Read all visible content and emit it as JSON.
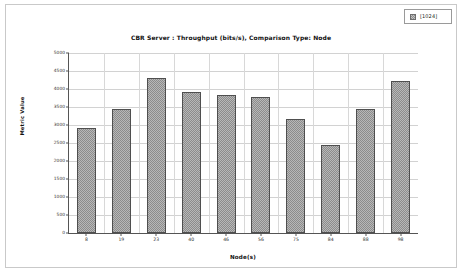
{
  "legend": {
    "entries": [
      {
        "label": "[1024]",
        "swatch_icon": "pattern-swatch-icon",
        "color": "#8c8c8c"
      }
    ]
  },
  "axes": {
    "y_title": "Metric Value",
    "x_title": "Node(s)"
  },
  "chart_data": {
    "type": "bar",
    "title": "CBR Server :  Throughput (bits/s), Comparison Type: Node",
    "xlabel": "Node(s)",
    "ylabel": "Metric Value",
    "categories": [
      "8",
      "19",
      "23",
      "40",
      "46",
      "56",
      "75",
      "84",
      "88",
      "98"
    ],
    "values": [
      2930,
      3450,
      4300,
      3920,
      3840,
      3780,
      3170,
      2450,
      3450,
      4230
    ],
    "series": [
      {
        "name": "[1024]",
        "values": [
          2930,
          3450,
          4300,
          3920,
          3840,
          3780,
          3170,
          2450,
          3450,
          4230
        ]
      }
    ],
    "ylim": [
      0,
      5000
    ],
    "yticks": [
      0,
      500,
      1000,
      1500,
      2000,
      2500,
      3000,
      3500,
      4000,
      4500,
      5000
    ],
    "ytick_labels": [
      "0",
      "500",
      "1000",
      "1500",
      "2000",
      "2500",
      "3000",
      "3500",
      "4000",
      "4500",
      "5000"
    ],
    "grid": true,
    "legend_position": "top-right",
    "bar_color": "#8c8c8c",
    "bar_edge_color": "#4f4f4f",
    "plot_background": "#ffffff",
    "gridline_color": "#d2d2d2"
  }
}
